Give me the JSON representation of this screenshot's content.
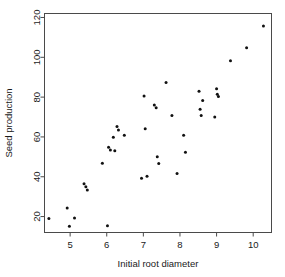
{
  "chart_data": {
    "type": "scatter",
    "title": "",
    "xlabel": "Initial root diameter",
    "ylabel": "Seed production",
    "xlim": [
      4.3,
      10.5
    ],
    "ylim": [
      12,
      122
    ],
    "xticks": [
      5,
      6,
      7,
      8,
      9,
      10
    ],
    "yticks": [
      20,
      40,
      60,
      80,
      100,
      120
    ],
    "xtick_labels": [
      "5",
      "6",
      "7",
      "8",
      "9",
      "10"
    ],
    "ytick_labels": [
      "20",
      "40",
      "60",
      "80",
      "100",
      "120"
    ],
    "grid": false,
    "legend": null,
    "marker": "filled-circle",
    "marker_color": "#111111",
    "points": [
      {
        "x": 4.42,
        "y": 19.0
      },
      {
        "x": 4.92,
        "y": 24.3
      },
      {
        "x": 4.98,
        "y": 15.2
      },
      {
        "x": 5.12,
        "y": 19.3
      },
      {
        "x": 5.38,
        "y": 36.5
      },
      {
        "x": 5.43,
        "y": 35.0
      },
      {
        "x": 5.47,
        "y": 33.4
      },
      {
        "x": 5.88,
        "y": 46.8
      },
      {
        "x": 6.02,
        "y": 15.4
      },
      {
        "x": 6.05,
        "y": 54.8
      },
      {
        "x": 6.1,
        "y": 53.4
      },
      {
        "x": 6.18,
        "y": 59.8
      },
      {
        "x": 6.22,
        "y": 53.0
      },
      {
        "x": 6.28,
        "y": 65.2
      },
      {
        "x": 6.32,
        "y": 63.5
      },
      {
        "x": 6.48,
        "y": 60.9
      },
      {
        "x": 6.95,
        "y": 39.2
      },
      {
        "x": 7.02,
        "y": 80.6
      },
      {
        "x": 7.05,
        "y": 64.1
      },
      {
        "x": 7.1,
        "y": 40.3
      },
      {
        "x": 7.3,
        "y": 76.0
      },
      {
        "x": 7.35,
        "y": 74.7
      },
      {
        "x": 7.38,
        "y": 50.0
      },
      {
        "x": 7.42,
        "y": 46.6
      },
      {
        "x": 7.62,
        "y": 87.4
      },
      {
        "x": 7.78,
        "y": 70.8
      },
      {
        "x": 7.92,
        "y": 41.6
      },
      {
        "x": 8.1,
        "y": 60.8
      },
      {
        "x": 8.15,
        "y": 52.3
      },
      {
        "x": 8.52,
        "y": 82.9
      },
      {
        "x": 8.55,
        "y": 73.9
      },
      {
        "x": 8.58,
        "y": 70.8
      },
      {
        "x": 8.62,
        "y": 78.3
      },
      {
        "x": 8.95,
        "y": 70.0
      },
      {
        "x": 9.0,
        "y": 84.2
      },
      {
        "x": 9.02,
        "y": 81.4
      },
      {
        "x": 9.05,
        "y": 80.3
      },
      {
        "x": 9.38,
        "y": 98.3
      },
      {
        "x": 9.82,
        "y": 104.8
      },
      {
        "x": 10.28,
        "y": 115.7
      }
    ]
  },
  "axes": {
    "x_title": "Initial root diameter",
    "y_title": "Seed production"
  }
}
